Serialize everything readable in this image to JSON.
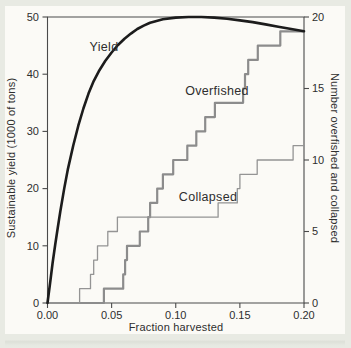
{
  "figure": {
    "page_background": "#e8eae3",
    "panel_background": "#fbfaf6",
    "axis_color": "#4a4a4a",
    "text_color": "#2e2e2e"
  },
  "chart_data": {
    "type": "line",
    "title": "",
    "xlabel": "Fraction harvested",
    "ylabel_left": "Sustainable yield (1000 of tons)",
    "ylabel_right": "Number overfished and collapsed",
    "xlim": [
      0,
      0.2
    ],
    "ylim_left": [
      0,
      50
    ],
    "ylim_right": [
      0,
      20
    ],
    "grid": false,
    "legend_position": "inline-labels",
    "x_ticks": [
      "0.00",
      "0.05",
      "0.10",
      "0.15",
      "0.20"
    ],
    "y_ticks_left": [
      "0",
      "10",
      "20",
      "30",
      "40",
      "50"
    ],
    "y_ticks_right": [
      "0",
      "5",
      "10",
      "15",
      "20"
    ],
    "series": [
      {
        "name": "Yield",
        "axis": "left",
        "style": "smooth",
        "color": "#1c1c1c",
        "width": 2.6,
        "points": [
          [
            0,
            0
          ],
          [
            0.002,
            3.5
          ],
          [
            0.004,
            7
          ],
          [
            0.006,
            10.2
          ],
          [
            0.008,
            13.2
          ],
          [
            0.01,
            16
          ],
          [
            0.013,
            20
          ],
          [
            0.016,
            23.5
          ],
          [
            0.02,
            27.5
          ],
          [
            0.024,
            31
          ],
          [
            0.028,
            34
          ],
          [
            0.032,
            36.6
          ],
          [
            0.036,
            38.8
          ],
          [
            0.04,
            40.5
          ],
          [
            0.045,
            42.3
          ],
          [
            0.05,
            43.8
          ],
          [
            0.055,
            45.1
          ],
          [
            0.06,
            46.2
          ],
          [
            0.065,
            47.1
          ],
          [
            0.07,
            47.9
          ],
          [
            0.075,
            48.5
          ],
          [
            0.08,
            49
          ],
          [
            0.09,
            49.6
          ],
          [
            0.1,
            49.9
          ],
          [
            0.11,
            50
          ],
          [
            0.12,
            50
          ],
          [
            0.13,
            49.9
          ],
          [
            0.14,
            49.7
          ],
          [
            0.15,
            49.4
          ],
          [
            0.16,
            49.1
          ],
          [
            0.17,
            48.7
          ],
          [
            0.18,
            48.3
          ],
          [
            0.19,
            47.9
          ],
          [
            0.2,
            47.5
          ]
        ]
      },
      {
        "name": "Overfished",
        "axis": "right",
        "style": "step",
        "color": "#8c8c8c",
        "width": 2.2,
        "steps": [
          [
            0.044,
            1
          ],
          [
            0.059,
            2
          ],
          [
            0.0605,
            3
          ],
          [
            0.062,
            4
          ],
          [
            0.072,
            5
          ],
          [
            0.0785,
            6
          ],
          [
            0.08,
            7
          ],
          [
            0.0855,
            8
          ],
          [
            0.09,
            9
          ],
          [
            0.098,
            10
          ],
          [
            0.109,
            11
          ],
          [
            0.116,
            12
          ],
          [
            0.123,
            13
          ],
          [
            0.1305,
            14
          ],
          [
            0.1525,
            15
          ],
          [
            0.154,
            16
          ],
          [
            0.1565,
            17
          ],
          [
            0.164,
            18
          ],
          [
            0.1815,
            19
          ]
        ],
        "end_value": 19
      },
      {
        "name": "Collapsed",
        "axis": "right",
        "style": "step",
        "color": "#949494",
        "width": 1.3,
        "steps": [
          [
            0.025,
            1
          ],
          [
            0.0335,
            2
          ],
          [
            0.036,
            3
          ],
          [
            0.039,
            4
          ],
          [
            0.047,
            5
          ],
          [
            0.0545,
            6
          ],
          [
            0.133,
            7
          ],
          [
            0.148,
            8
          ],
          [
            0.15,
            9
          ],
          [
            0.1635,
            10
          ],
          [
            0.1915,
            11
          ]
        ],
        "end_value": 11
      }
    ],
    "annotations": [
      {
        "text": "Yield",
        "px": [
          104,
          47
        ]
      },
      {
        "text": "Overfished",
        "px": [
          217,
          91
        ]
      },
      {
        "text": "Collapsed",
        "px": [
          208,
          197
        ]
      }
    ]
  }
}
